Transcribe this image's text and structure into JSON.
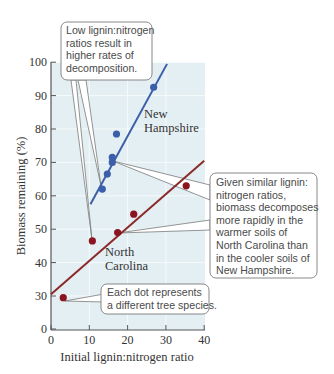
{
  "chart_data": {
    "type": "scatter",
    "title": "",
    "xlabel": "Initial lignin:nitrogen ratio",
    "ylabel": "Biomass remaining (%)",
    "xlim": [
      0,
      40
    ],
    "ylim": [
      0,
      100
    ],
    "x_ticks": [
      "0",
      "10",
      "20",
      "30",
      "40"
    ],
    "y_ticks": [
      "0",
      "30",
      "40",
      "50",
      "60",
      "70",
      "80",
      "90",
      "100"
    ],
    "y_axis_break": "between 0 and 30",
    "grid": true,
    "legend": null,
    "series": [
      {
        "name": "New Hampshire",
        "color": "#3b5fa8",
        "points": [
          {
            "x": 13.4,
            "y": 62
          },
          {
            "x": 14.7,
            "y": 66.5
          },
          {
            "x": 16,
            "y": 70
          },
          {
            "x": 16,
            "y": 71.5
          },
          {
            "x": 17.1,
            "y": 78.5
          },
          {
            "x": 26.8,
            "y": 92.5
          }
        ],
        "trend_line": {
          "x0": 10.3,
          "y0": 57.5,
          "x1": 30.3,
          "y1": 99.5
        }
      },
      {
        "name": "North Carolina",
        "color": "#8a1420",
        "line_color": "#8b2a2a",
        "points": [
          {
            "x": 3.2,
            "y": 28.5
          },
          {
            "x": 10.8,
            "y": 46.5
          },
          {
            "x": 17.4,
            "y": 49
          },
          {
            "x": 21.6,
            "y": 54.5
          },
          {
            "x": 35.3,
            "y": 63
          }
        ],
        "trend_line": {
          "x0": 0,
          "y0": 30.5,
          "x1": 40,
          "y1": 70.5
        }
      }
    ],
    "annotations": [
      {
        "id": "low-ratio",
        "lines": [
          "Low lignin:nitrogen",
          "ratios result in",
          "higher rates of",
          "decomposition."
        ]
      },
      {
        "id": "climate",
        "lines": [
          "Given similar lignin:",
          "nitrogen ratios,",
          "biomass decomposes",
          "more rapidly in the",
          "warmer soils of",
          "North Carolina than",
          "in the cooler soils of",
          "New Hampshire."
        ]
      },
      {
        "id": "each-dot",
        "lines": [
          "Each dot represents",
          "a different tree species."
        ]
      }
    ],
    "series_labels": {
      "nh": [
        "New",
        "Hampshire"
      ],
      "nc": [
        "North",
        "Carolina"
      ]
    }
  },
  "colors": {
    "plot_bg": "#e4eff3",
    "grid": "#f6fafb",
    "axis": "#555555",
    "callout_border": "#7a7a7a"
  }
}
